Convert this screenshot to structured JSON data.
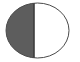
{
  "figure": {
    "name": "half-filled-circle-icon",
    "canvas": {
      "width": 80,
      "height": 62,
      "background_color": "#ffffff"
    },
    "circle": {
      "center_x": 37.5,
      "center_y": 30.5,
      "radius_x": 31.5,
      "radius_y": 27.5,
      "outline_color": "#4a4a4a",
      "outline_width": 1
    },
    "left_half": {
      "label": "filled-half",
      "fill_color": "#5d5d5d"
    },
    "right_half": {
      "label": "empty-half",
      "fill_color": "#ffffff"
    },
    "divider": {
      "label": "vertical-divider",
      "x": 34,
      "y_top": 3,
      "y_bottom": 58,
      "color": "#3d3d3d",
      "width": 1.6
    }
  }
}
